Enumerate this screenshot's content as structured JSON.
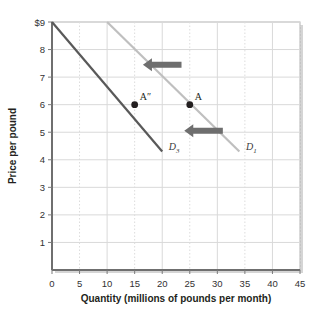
{
  "chart_data": {
    "type": "line",
    "title": "",
    "xlabel": "Quantity (millions of pounds per month)",
    "ylabel": "Price per pound",
    "xlim": [
      0,
      45
    ],
    "ylim": [
      0,
      9
    ],
    "xticks": [
      "0",
      "5",
      "10",
      "15",
      "20",
      "25",
      "30",
      "35",
      "40",
      "45"
    ],
    "yticks": [
      "1",
      "2",
      "3",
      "4",
      "5",
      "6",
      "7",
      "8",
      "$9"
    ],
    "grid": true,
    "legend": "none",
    "series": [
      {
        "name": "D1",
        "label": "D",
        "subscript": "1",
        "color": "#bfbfbf",
        "points": [
          [
            10,
            9
          ],
          [
            34,
            4.3
          ]
        ],
        "label_x": 35.2,
        "label_y": 4.35
      },
      {
        "name": "D3",
        "label": "D",
        "subscript": "3",
        "color": "#595959",
        "points": [
          [
            0,
            9
          ],
          [
            20,
            4.3
          ]
        ],
        "label_x": 21.2,
        "label_y": 4.35
      }
    ],
    "points": [
      {
        "label": "A″",
        "x": 15,
        "y": 6,
        "color": "#231f20",
        "label_dx": 5,
        "label_dy": -5
      },
      {
        "label": "A",
        "x": 25,
        "y": 6,
        "color": "#231f20",
        "label_dx": 5,
        "label_dy": -5
      }
    ],
    "annotations": [
      {
        "type": "arrow",
        "direction": "left",
        "name": "shift-arrow-upper",
        "x_from": 23.5,
        "x_to": 16.5,
        "y": 7.45,
        "color": "#6e6e6e"
      },
      {
        "type": "arrow",
        "direction": "left",
        "name": "shift-arrow-lower",
        "x_from": 31.0,
        "x_to": 24.0,
        "y": 5.05,
        "color": "#6e6e6e"
      }
    ]
  },
  "colors": {
    "background": "#ffffff",
    "plot_border": "#b3b3b3",
    "gridline_major": "#d9d9d9",
    "gridline_minor": "#dcdcdc",
    "axis_line": "#7a7a7a",
    "demand_original": "#bfbfbf",
    "demand_shifted": "#595959",
    "arrow": "#6e6e6e",
    "point": "#231f20",
    "text": "#231f20"
  }
}
